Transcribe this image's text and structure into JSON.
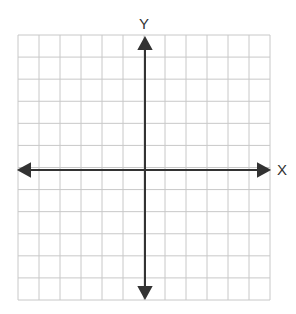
{
  "diagram": {
    "type": "coordinate-plane",
    "x_axis_label": "X",
    "y_axis_label": "Y",
    "grid": {
      "columns": 12,
      "rows": 12,
      "line_color": "#c8c8c8"
    },
    "axis_color": "#333333"
  }
}
